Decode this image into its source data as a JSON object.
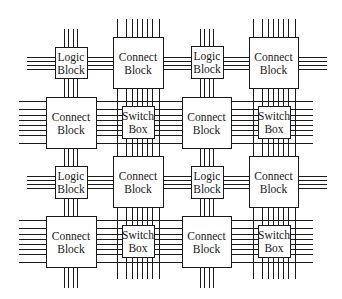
{
  "diagram": {
    "colors": {
      "line": "#1a1a1a",
      "fill": "#ffffff",
      "background": "#ffffff"
    },
    "labels": {
      "logic_block": [
        "Logic",
        "Block"
      ],
      "connect_block": [
        "Connect",
        "Block"
      ],
      "switch_box": [
        "Switch",
        "Box"
      ]
    },
    "blocks": [
      {
        "id": "lb-r1c1",
        "type": "logic_block",
        "line1": "Logic",
        "line2": "Block",
        "x": 55,
        "y": 47,
        "w": 32,
        "h": 31
      },
      {
        "id": "cb-r1c2",
        "type": "connect_block",
        "line1": "Connect",
        "line2": "Block",
        "x": 113,
        "y": 37,
        "w": 50,
        "h": 51
      },
      {
        "id": "lb-r1c3",
        "type": "logic_block",
        "line1": "Logic",
        "line2": "Block",
        "x": 191,
        "y": 46,
        "w": 32,
        "h": 32
      },
      {
        "id": "cb-r1c4",
        "type": "connect_block",
        "line1": "Connect",
        "line2": "Block",
        "x": 249,
        "y": 37,
        "w": 49,
        "h": 51
      },
      {
        "id": "cb-r2c1",
        "type": "connect_block",
        "line1": "Connect",
        "line2": "Block",
        "x": 46,
        "y": 97,
        "w": 50,
        "h": 51
      },
      {
        "id": "sb-r2c2",
        "type": "switch_box",
        "line1": "Switch",
        "line2": "Box",
        "x": 122,
        "y": 106,
        "w": 32,
        "h": 32
      },
      {
        "id": "cb-r2c3",
        "type": "connect_block",
        "line1": "Connect",
        "line2": "Block",
        "x": 182,
        "y": 97,
        "w": 49,
        "h": 51
      },
      {
        "id": "sb-r2c4",
        "type": "switch_box",
        "line1": "Switch",
        "line2": "Box",
        "x": 258,
        "y": 106,
        "w": 32,
        "h": 32
      },
      {
        "id": "lb-r3c1",
        "type": "logic_block",
        "line1": "Logic",
        "line2": "Block",
        "x": 55,
        "y": 166,
        "w": 32,
        "h": 32
      },
      {
        "id": "cb-r3c2",
        "type": "connect_block",
        "line1": "Connect",
        "line2": "Block",
        "x": 113,
        "y": 156,
        "w": 50,
        "h": 51
      },
      {
        "id": "lb-r3c3",
        "type": "logic_block",
        "line1": "Logic",
        "line2": "Block",
        "x": 191,
        "y": 166,
        "w": 32,
        "h": 32
      },
      {
        "id": "cb-r3c4",
        "type": "connect_block",
        "line1": "Connect",
        "line2": "Block",
        "x": 249,
        "y": 156,
        "w": 49,
        "h": 51
      },
      {
        "id": "cb-r4c1",
        "type": "connect_block",
        "line1": "Connect",
        "line2": "Block",
        "x": 46,
        "y": 216,
        "w": 50,
        "h": 51
      },
      {
        "id": "sb-r4c2",
        "type": "switch_box",
        "line1": "Switch",
        "line2": "Box",
        "x": 122,
        "y": 225,
        "w": 32,
        "h": 32
      },
      {
        "id": "cb-r4c3",
        "type": "connect_block",
        "line1": "Connect",
        "line2": "Block",
        "x": 182,
        "y": 216,
        "w": 49,
        "h": 51
      },
      {
        "id": "sb-r4c4",
        "type": "switch_box",
        "line1": "Switch",
        "line2": "Box",
        "x": 258,
        "y": 225,
        "w": 32,
        "h": 32
      }
    ]
  }
}
